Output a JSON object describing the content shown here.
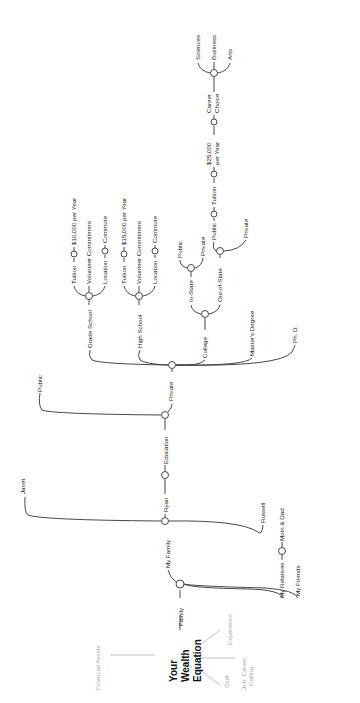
{
  "diagram": {
    "title": [
      "Your",
      "Wealth",
      "Equation"
    ],
    "orientation": "rotated -90deg (reads bottom-to-top)",
    "branches_light": {
      "financial_assets": "Financial Assets",
      "stuff": "Stuff",
      "experience": "Experience",
      "job": [
        "Job, Career,",
        "Calling"
      ]
    },
    "family": {
      "label": "Family",
      "my_family": "My Family",
      "janet": "Janet",
      "ryan": "Ryan",
      "russell": "Russell",
      "my_relatives": "My Relatives",
      "mom_dad": "Mom & Dad",
      "my_friends": "My Friends"
    },
    "education": {
      "label": "Education",
      "public": "Public",
      "private": "Private",
      "grade_school": {
        "label": "Grade School",
        "tuition": "Tuition",
        "tuition_cost": "$10,000 per Year",
        "volunteer": "Volunteer Commitment",
        "location": "Location",
        "commute": "Commute"
      },
      "high_school": {
        "label": "High School",
        "tuition": "Tuition",
        "tuition_cost": "$15,000 per Year",
        "volunteer": "Volunteer Commitment",
        "location": "Location",
        "commute": "Commute"
      },
      "college": {
        "label": "College",
        "in_state": "In-State",
        "in_state_public": "Public",
        "in_state_private": "Private",
        "out_of_state": "Out-of-State",
        "oos_public": "Public",
        "oos_private": "Private",
        "tuition": "Tuition",
        "tuition_cost": [
          "$25,000",
          "per Year"
        ],
        "career_choice": [
          "Career",
          "Choice"
        ],
        "sciences": "Sciences",
        "business": "Business",
        "arts": "Arts"
      },
      "masters": "Master's Degree",
      "phd": "Ph. D."
    }
  }
}
